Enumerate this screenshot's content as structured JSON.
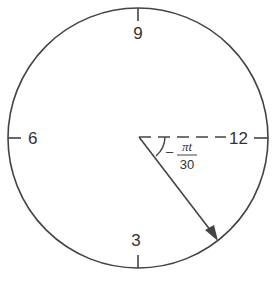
{
  "diagram": {
    "type": "clock-face",
    "labels": {
      "top": "9",
      "left": "6",
      "bottom": "3",
      "right": "12"
    },
    "angle_label": {
      "sign": "–",
      "numerator": "πt",
      "denominator": "30"
    },
    "colors": {
      "stroke": "#444444",
      "text": "#333333"
    }
  }
}
